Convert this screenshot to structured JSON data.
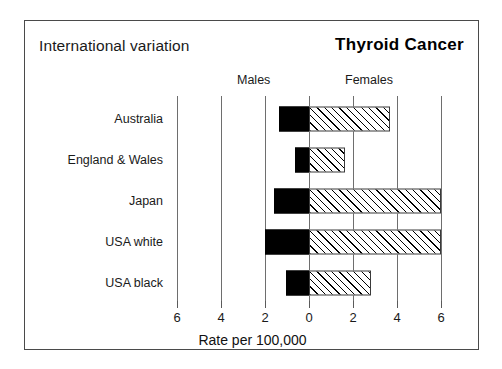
{
  "header": {
    "subtitle": "International variation",
    "title": "Thyroid Cancer"
  },
  "groups": {
    "males_label": "Males",
    "females_label": "Females"
  },
  "axis": {
    "title": "Rate per 100,000",
    "tick_labels": [
      "6",
      "4",
      "2",
      "0",
      "2",
      "4",
      "6"
    ],
    "tick_values": [
      -6,
      -4,
      -2,
      0,
      2,
      4,
      6
    ]
  },
  "colors": {
    "male_bar": "#000000",
    "female_bar_outline": "#3a3a3a",
    "female_bar_fill": "#ffffff",
    "gridline": "#6e6e6e",
    "frame": "#4a4a4a",
    "text": "#1a1a1a"
  },
  "chart_data": {
    "type": "bar",
    "orientation": "horizontal",
    "layout": "bidirectional-population-pyramid",
    "title": "Thyroid Cancer",
    "subtitle": "International variation",
    "xlabel": "Rate per 100,000",
    "ylabel": "",
    "xlim": [
      -6,
      6
    ],
    "xticks": [
      -6,
      -4,
      -2,
      0,
      2,
      4,
      6
    ],
    "xticklabels": [
      "6",
      "4",
      "2",
      "0",
      "2",
      "4",
      "6"
    ],
    "grid": true,
    "legend_position": "top",
    "categories": [
      "Australia",
      "England & Wales",
      "Japan",
      "USA white",
      "USA black"
    ],
    "series": [
      {
        "name": "Males",
        "direction": "left",
        "style": "solid-black",
        "values": [
          1.35,
          0.65,
          1.6,
          2.0,
          1.05
        ]
      },
      {
        "name": "Females",
        "direction": "right",
        "style": "hatched",
        "values": [
          3.7,
          1.65,
          6.0,
          6.0,
          2.8
        ]
      }
    ]
  }
}
